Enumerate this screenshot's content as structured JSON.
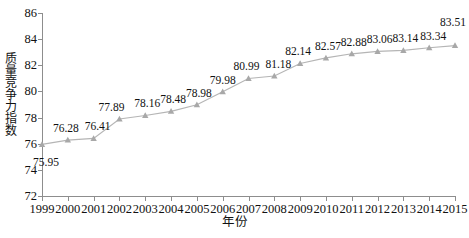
{
  "chart_data": {
    "type": "line",
    "title": "",
    "xlabel": "年份",
    "ylabel": "质量竞争力指数",
    "categories": [
      "1999",
      "2000",
      "2001",
      "2002",
      "2003",
      "2004",
      "2005",
      "2006",
      "2007",
      "2008",
      "2009",
      "2010",
      "2011",
      "2012",
      "2013",
      "2014",
      "2015"
    ],
    "values": [
      75.95,
      76.28,
      76.41,
      77.89,
      78.16,
      78.48,
      78.98,
      79.98,
      80.99,
      81.18,
      82.14,
      82.57,
      82.88,
      83.06,
      83.14,
      83.34,
      83.51
    ],
    "point_labels": [
      "75.95",
      "76.28",
      "76.41",
      "77.89",
      "78.16",
      "78.48",
      "78.98",
      "79.98",
      "80.99",
      "81.18",
      "82.14",
      "82.57",
      "82.88",
      "83.06",
      "83.14",
      "83.34",
      "83.51"
    ],
    "xlim": [
      1999,
      2015
    ],
    "ylim": [
      72,
      86
    ],
    "yticks": [
      72,
      74,
      76,
      78,
      80,
      82,
      84,
      86
    ],
    "ytick_labels": [
      "72",
      "74",
      "76",
      "78",
      "80",
      "82",
      "84",
      "86"
    ],
    "xticks": [
      "1999",
      "2000",
      "2001",
      "2002",
      "2003",
      "2004",
      "2005",
      "2006",
      "2007",
      "2008",
      "2009",
      "2010",
      "2011",
      "2012",
      "2013",
      "2014",
      "2015"
    ],
    "grid": false,
    "legend": null,
    "series_color": "#b5b5b5",
    "marker": "triangle",
    "marker_color": "#a8a8a8",
    "axis_color": "#8d8d8d",
    "text_color": "#111111",
    "label_offsets": [
      {
        "dx": 4,
        "dy": 24
      },
      {
        "dx": -2,
        "dy": -6
      },
      {
        "dx": 4,
        "dy": -6
      },
      {
        "dx": -8,
        "dy": -6
      },
      {
        "dx": 2,
        "dy": -6
      },
      {
        "dx": 2,
        "dy": -6
      },
      {
        "dx": 2,
        "dy": -6
      },
      {
        "dx": 0,
        "dy": -6
      },
      {
        "dx": -2,
        "dy": -6
      },
      {
        "dx": 4,
        "dy": -6
      },
      {
        "dx": -2,
        "dy": -6
      },
      {
        "dx": 2,
        "dy": -6
      },
      {
        "dx": 2,
        "dy": -6
      },
      {
        "dx": 2,
        "dy": -6
      },
      {
        "dx": 2,
        "dy": -6
      },
      {
        "dx": 4,
        "dy": -6
      },
      {
        "dx": -2,
        "dy": -18
      }
    ]
  }
}
